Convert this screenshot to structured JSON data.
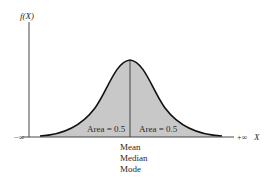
{
  "diagram": {
    "y_axis_label": "f(X)",
    "x_axis_label": "X",
    "x_left_label": "−∞",
    "x_right_label": "+∞",
    "left_area_label": "Area = 0.5",
    "right_area_label": "Area = 0.5",
    "center_labels": [
      "Mean",
      "Median",
      "Mode"
    ],
    "colors": {
      "fill": "#c8c8c8",
      "stroke": "#111111",
      "axis": "#333333"
    }
  }
}
